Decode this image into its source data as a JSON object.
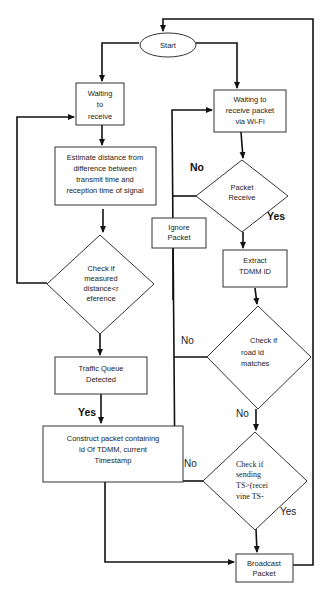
{
  "diagram": {
    "type": "flowchart",
    "nodes": {
      "start": {
        "label": "Start",
        "shape": "ellipse"
      },
      "waiting_receive": {
        "lines": [
          "Waiting",
          "to",
          "receive"
        ],
        "shape": "rect"
      },
      "estimate": {
        "lines": [
          "Estimate distance from",
          "difference between",
          "transmit time and",
          "reception time of signal"
        ],
        "shape": "rect"
      },
      "check_distance": {
        "lines": [
          "Check if",
          "measured",
          "distance<r",
          "eference"
        ],
        "shape": "diamond"
      },
      "traffic_queue": {
        "lines": [
          "Traffic Queue",
          "Detected"
        ],
        "shape": "rect"
      },
      "construct": {
        "lines": [
          "Construct packet containing",
          "id Of TDMM, current",
          "Timestamp"
        ],
        "shape": "rect"
      },
      "waiting_packet": {
        "lines": [
          "Waiting to",
          "receive packet",
          "via Wi-Fi"
        ],
        "shape": "rect"
      },
      "packet_receive": {
        "lines": [
          "Packet",
          "Receive"
        ],
        "shape": "diamond"
      },
      "ignore_packet": {
        "lines": [
          "Ignore",
          "Packet"
        ],
        "shape": "rect"
      },
      "extract": {
        "lines": [
          "Extract",
          "TDMM ID"
        ],
        "shape": "rect"
      },
      "check_road": {
        "lines": [
          "Check if",
          "road id",
          "matches"
        ],
        "shape": "diamond"
      },
      "check_sending": {
        "lines": [
          "Check if",
          "sending",
          "TS>(recei",
          "vine TS-"
        ],
        "shape": "diamond"
      },
      "broadcast": {
        "lines": [
          "Broadcast",
          "Packet"
        ],
        "shape": "rect"
      }
    },
    "edge_labels": {
      "yes_traffic": "Yes",
      "no_packet": "No",
      "yes_packet": "Yes",
      "no_road_left": "No",
      "no_road_down": "No",
      "no_sending": "No",
      "yes_sending": "Yes"
    },
    "edges": [
      {
        "from": "start",
        "to": "waiting_receive"
      },
      {
        "from": "start",
        "to": "waiting_packet"
      },
      {
        "from": "waiting_receive",
        "to": "estimate"
      },
      {
        "from": "estimate",
        "to": "check_distance"
      },
      {
        "from": "check_distance",
        "to": "waiting_receive",
        "label": ""
      },
      {
        "from": "check_distance",
        "to": "traffic_queue"
      },
      {
        "from": "traffic_queue",
        "to": "construct",
        "label": "Yes"
      },
      {
        "from": "construct",
        "to": "broadcast"
      },
      {
        "from": "waiting_packet",
        "to": "packet_receive"
      },
      {
        "from": "packet_receive",
        "to": "waiting_packet",
        "label": "No"
      },
      {
        "from": "packet_receive",
        "to": "extract",
        "label": "Yes"
      },
      {
        "from": "extract",
        "to": "check_road"
      },
      {
        "from": "check_road",
        "to": "waiting_packet",
        "label": "No"
      },
      {
        "from": "check_road",
        "to": "check_sending",
        "label": "No"
      },
      {
        "from": "check_sending",
        "to": "waiting_packet",
        "label": "No"
      },
      {
        "from": "check_sending",
        "to": "broadcast",
        "label": "Yes"
      },
      {
        "from": "broadcast",
        "to": "start"
      }
    ]
  }
}
